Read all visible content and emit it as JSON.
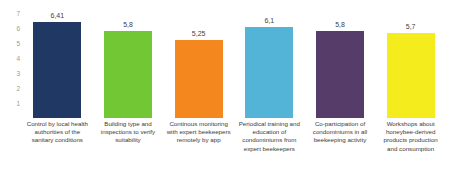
{
  "chart_data": {
    "type": "bar",
    "title": "",
    "subtitle": "",
    "xlabel": "",
    "ylabel": "",
    "ylim": [
      0,
      7.5
    ],
    "grid": false,
    "legend": "none",
    "y_ticks": [
      "7",
      "6",
      "5",
      "4",
      "3",
      "2",
      "1"
    ],
    "categories": [
      "Control by local health authorities of the sanitary conditions",
      "Building type and inspections to verify suitability",
      "Continous monitoring with expert beekeepers remotely by app",
      "Periodical training and education of condominiums from expert beekeepers",
      "Co-participation of condominiums in all beekeeping activity",
      "Workshops about honeybee-derived products production and consumption"
    ],
    "values": [
      6.41,
      5.8,
      5.25,
      6.1,
      5.8,
      5.7
    ],
    "value_labels": [
      "6,41",
      "5,8",
      "5,25",
      "6,1",
      "5,8",
      "5,7"
    ],
    "colors": [
      "#1F3864",
      "#71C834",
      "#F5871F",
      "#53B4D8",
      "#563D69",
      "#F5EC1D"
    ]
  }
}
